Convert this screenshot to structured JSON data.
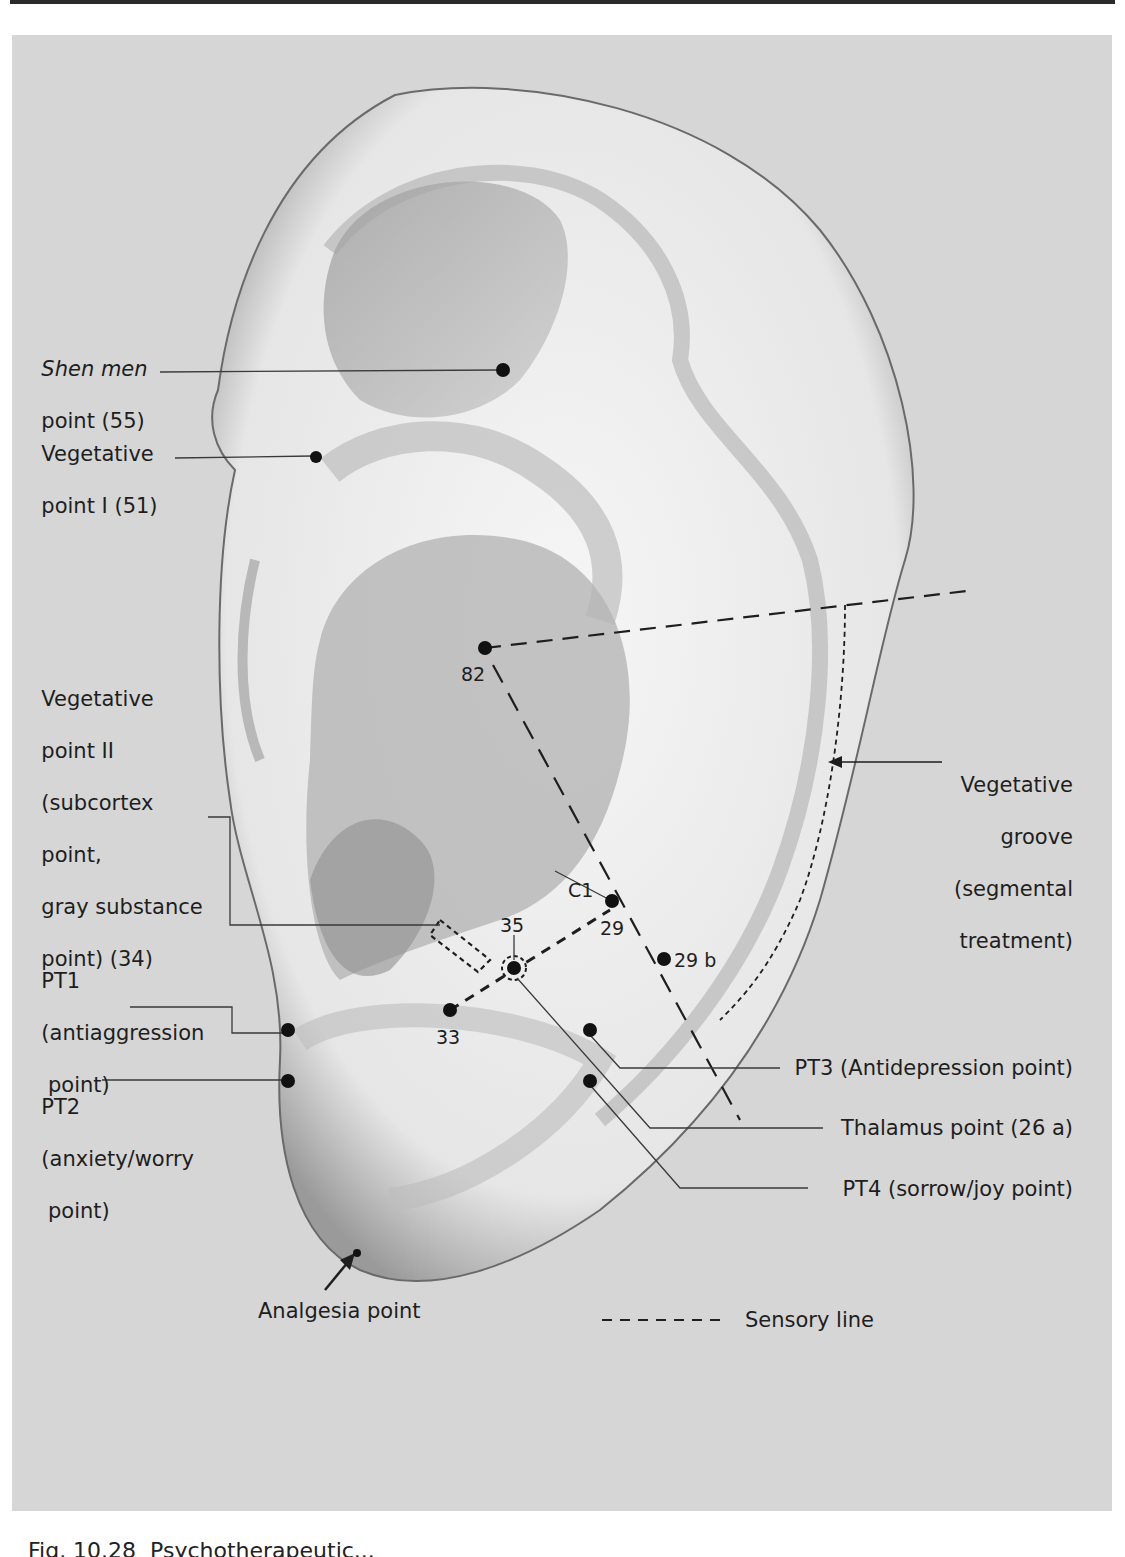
{
  "figure": {
    "background_color": "#d6d6d6",
    "ear_fill": "#f4f4f4",
    "ear_shadow": "#8a8a8a",
    "point_color": "#111111"
  },
  "labels": {
    "shen_men": {
      "line1": "Shen men",
      "line2": "point (55)"
    },
    "veg_point_1": {
      "line1": "Vegetative",
      "line2": "point I (51)"
    },
    "veg_point_2": {
      "line1": "Vegetative",
      "line2": "point II",
      "line3": "(subcortex",
      "line4": "point,",
      "line5": "gray substance",
      "line6": "point) (34)"
    },
    "pt1": {
      "line1": "PT1",
      "line2": "(antiaggression",
      "line3": " point)"
    },
    "pt2": {
      "line1": "PT2",
      "line2": "(anxiety/worry",
      "line3": " point)"
    },
    "analgesia": "Analgesia point",
    "veg_groove": {
      "line1": "Vegetative",
      "line2": "groove",
      "line3": "(segmental",
      "line4": "treatment)"
    },
    "pt3": "PT3 (Antidepression point)",
    "thalamus": "Thalamus point (26 a)",
    "pt4": "PT4 (sorrow/joy point)",
    "legend": {
      "dash_sample": "- - - - - -",
      "text": "Sensory line"
    }
  },
  "point_numbers": {
    "p82": "82",
    "c1": "C1",
    "p29": "29",
    "p29b": "29 b",
    "p35": "35",
    "p33": "33"
  },
  "caption": "Fig. 10.28  Psychotherapeutic..."
}
